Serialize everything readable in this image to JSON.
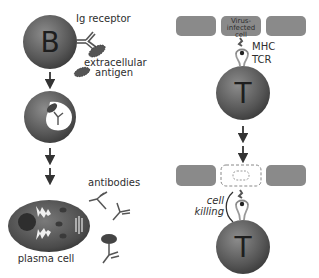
{
  "diagram": {
    "b_cell_pathway": {
      "b_cell_letter": "B",
      "ig_receptor_label": "Ig receptor",
      "antigen_label_line1": "extracellular",
      "antigen_label_line2": "antigen",
      "antibodies_label": "antibodies",
      "plasma_cell_label": "plasma cell"
    },
    "t_cell_pathway": {
      "infected_cell_line1": "Virus-",
      "infected_cell_line2": "infected",
      "infected_cell_line3": "cell",
      "mhc_label": "MHC",
      "tcr_label": "TCR",
      "t_cell_letter_top": "T",
      "t_cell_letter_bottom": "T",
      "cell_killing_line1": "cell",
      "cell_killing_line2": "killing"
    },
    "colors": {
      "cell_dark": "#4a4a4a",
      "cell_mid": "#7a7a7a",
      "tissue_cell": "#8a8a8a",
      "text": "#2e2e2e",
      "background": "#ffffff"
    }
  }
}
